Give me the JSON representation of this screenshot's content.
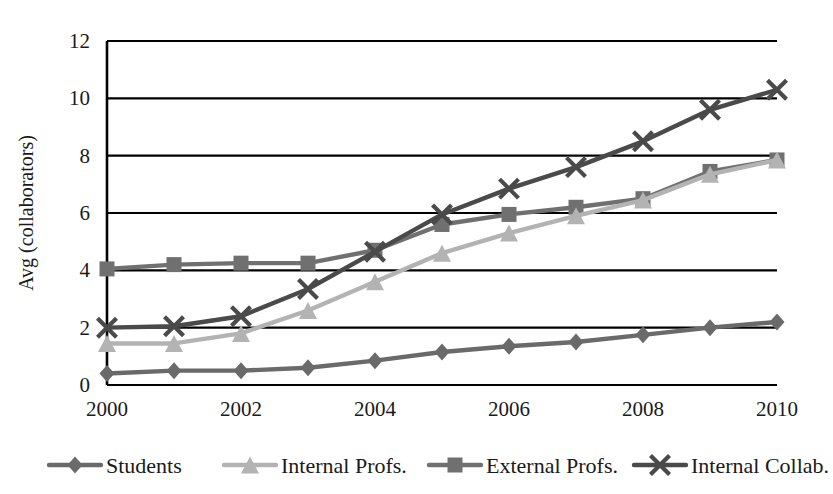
{
  "chart_data": {
    "type": "line",
    "title": "",
    "subtitle": "",
    "xlabel": "",
    "ylabel": "Avg (collaborators)",
    "x": [
      2000,
      2001,
      2002,
      2003,
      2004,
      2005,
      2006,
      2007,
      2008,
      2009,
      2010
    ],
    "xticklabels": [
      "2000",
      "2002",
      "2004",
      "2006",
      "2008",
      "2010"
    ],
    "xtickvalues": [
      2000,
      2002,
      2004,
      2006,
      2008,
      2010
    ],
    "yticklabels": [
      "0",
      "2",
      "4",
      "6",
      "8",
      "10",
      "12"
    ],
    "ytickvalues": [
      0,
      2,
      4,
      6,
      8,
      10,
      12
    ],
    "xlim": [
      2000,
      2010
    ],
    "ylim": [
      0,
      12
    ],
    "grid": "horizontal",
    "legend_position": "bottom",
    "series": [
      {
        "name": "Students",
        "marker": "diamond",
        "color": "#6a6a6a",
        "values": [
          0.4,
          0.5,
          0.5,
          0.6,
          0.85,
          1.15,
          1.35,
          1.5,
          1.75,
          2.0,
          2.2
        ]
      },
      {
        "name": "Internal Profs.",
        "marker": "triangle",
        "color": "#b3b3b3",
        "values": [
          1.45,
          1.45,
          1.8,
          2.6,
          3.6,
          4.6,
          5.3,
          5.9,
          6.45,
          7.35,
          7.85
        ]
      },
      {
        "name": "External Profs.",
        "marker": "square",
        "color": "#707070",
        "values": [
          4.05,
          4.2,
          4.25,
          4.25,
          4.7,
          5.6,
          5.95,
          6.2,
          6.5,
          7.45,
          7.85
        ]
      },
      {
        "name": "Internal Collab.",
        "marker": "x",
        "color": "#4a4a4a",
        "values": [
          2.0,
          2.05,
          2.4,
          3.35,
          4.65,
          5.95,
          6.85,
          7.6,
          8.5,
          9.6,
          10.3
        ]
      }
    ]
  },
  "axes": {
    "y_title": "Avg (collaborators)"
  },
  "legend": {
    "items": [
      {
        "label": "Students"
      },
      {
        "label": "Internal Profs."
      },
      {
        "label": "External Profs."
      },
      {
        "label": "Internal Collab."
      }
    ]
  },
  "colors": {
    "axis": "#000000",
    "grid": "#000000",
    "background": "#ffffff",
    "text": "#1a1a1a"
  }
}
